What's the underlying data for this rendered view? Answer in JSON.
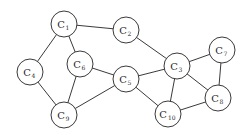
{
  "diagram": {
    "type": "undirected-graph",
    "nodes": [
      {
        "id": "C1",
        "base": "C",
        "sub": "1",
        "x": 64,
        "y": 24
      },
      {
        "id": "C2",
        "base": "C",
        "sub": "2",
        "x": 126,
        "y": 30
      },
      {
        "id": "C3",
        "base": "C",
        "sub": "3",
        "x": 177,
        "y": 66
      },
      {
        "id": "C4",
        "base": "C",
        "sub": "4",
        "x": 30,
        "y": 72
      },
      {
        "id": "C5",
        "base": "C",
        "sub": "5",
        "x": 126,
        "y": 79
      },
      {
        "id": "C6",
        "base": "C",
        "sub": "6",
        "x": 80,
        "y": 64
      },
      {
        "id": "C7",
        "base": "C",
        "sub": "7",
        "x": 222,
        "y": 50
      },
      {
        "id": "C8",
        "base": "C",
        "sub": "8",
        "x": 218,
        "y": 98
      },
      {
        "id": "C9",
        "base": "C",
        "sub": "9",
        "x": 64,
        "y": 115
      },
      {
        "id": "C10",
        "base": "C",
        "sub": "10",
        "x": 168,
        "y": 114
      }
    ],
    "edges": [
      [
        "C1",
        "C2"
      ],
      [
        "C1",
        "C4"
      ],
      [
        "C1",
        "C6"
      ],
      [
        "C2",
        "C3"
      ],
      [
        "C4",
        "C9"
      ],
      [
        "C6",
        "C9"
      ],
      [
        "C6",
        "C5"
      ],
      [
        "C5",
        "C9"
      ],
      [
        "C5",
        "C3"
      ],
      [
        "C5",
        "C10"
      ],
      [
        "C3",
        "C10"
      ],
      [
        "C3",
        "C7"
      ],
      [
        "C3",
        "C8"
      ],
      [
        "C7",
        "C8"
      ],
      [
        "C10",
        "C8"
      ]
    ],
    "node_radius": 13,
    "colors": {
      "stroke": "#3a3a3a",
      "fill": "#ffffff",
      "text": "#2a2a2a"
    }
  }
}
